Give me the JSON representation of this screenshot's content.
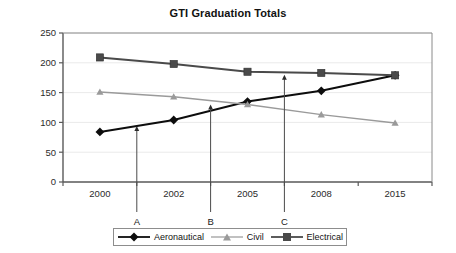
{
  "chart_data": {
    "type": "line",
    "title": "GTI Graduation Totals",
    "xlabel": "",
    "ylabel": "",
    "categories": [
      "2000",
      "2002",
      "2005",
      "2008",
      "2015"
    ],
    "ylim": [
      0,
      250
    ],
    "yticks": [
      0,
      50,
      100,
      150,
      200,
      250
    ],
    "grid": true,
    "legend_position": "bottom",
    "series": [
      {
        "name": "Aeronautical",
        "marker": "diamond",
        "color": "#0d0d0d",
        "values": [
          84,
          104,
          135,
          153,
          179
        ]
      },
      {
        "name": "Civil",
        "marker": "triangle",
        "color": "#9a9a9a",
        "values": [
          151,
          143,
          130,
          113,
          99
        ]
      },
      {
        "name": "Electrical",
        "marker": "square",
        "color": "#4a4a4a",
        "values": [
          209,
          198,
          185,
          183,
          179
        ]
      }
    ],
    "annotations": [
      {
        "label": "A",
        "x_category_fraction": 0.5,
        "between": [
          "2000",
          "2002"
        ],
        "points_to_series": "Aeronautical",
        "value": 94
      },
      {
        "label": "B",
        "x_category_fraction": 0.5,
        "between": [
          "2002",
          "2005"
        ],
        "points_to_series": "Aeronautical",
        "value": 130
      },
      {
        "label": "C",
        "x_category_fraction": 0.5,
        "between": [
          "2005",
          "2008"
        ],
        "points_to_series": "Electrical",
        "value": 180
      }
    ]
  },
  "axis": {
    "y_tick_labels": [
      "250",
      "200",
      "150",
      "100",
      "50",
      "0"
    ],
    "x_tick_labels": [
      "2000",
      "2002",
      "2005",
      "2008",
      "2015"
    ]
  },
  "legend": {
    "items": [
      {
        "label": "Aeronautical",
        "marker": "diamond-marker",
        "color": "#0d0d0d"
      },
      {
        "label": "Civil",
        "marker": "triangle-marker",
        "color": "#9a9a9a"
      },
      {
        "label": "Electrical",
        "marker": "square-marker",
        "color": "#4a4a4a"
      }
    ]
  }
}
